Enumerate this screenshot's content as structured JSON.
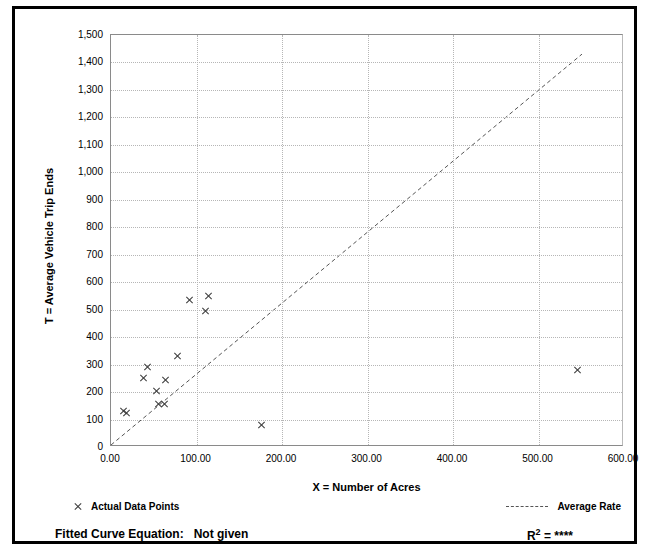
{
  "chart_data": {
    "type": "scatter",
    "title": "",
    "xlabel": "X = Number of Acres",
    "ylabel": "T = Average Vehicle Trip Ends",
    "xlim": [
      0,
      600
    ],
    "ylim": [
      0,
      1500
    ],
    "xticks": [
      "0.00",
      "100.00",
      "200.00",
      "300.00",
      "400.00",
      "500.00",
      "600.00"
    ],
    "xtick_values": [
      0,
      100,
      200,
      300,
      400,
      500,
      600
    ],
    "yticks": [
      "0",
      "100",
      "200",
      "300",
      "400",
      "500",
      "600",
      "700",
      "800",
      "900",
      "1,000",
      "1,100",
      "1,200",
      "1,300",
      "1,400",
      "1,500"
    ],
    "ytick_values": [
      0,
      100,
      200,
      300,
      400,
      500,
      600,
      700,
      800,
      900,
      1000,
      1100,
      1200,
      1300,
      1400,
      1500
    ],
    "grid": true,
    "legend_position": "below-plot",
    "series": [
      {
        "name": "Actual Data Points",
        "marker": "x",
        "color": "#3a3a3a",
        "points": [
          {
            "x": 15,
            "y": 130
          },
          {
            "x": 18,
            "y": 122
          },
          {
            "x": 38,
            "y": 250
          },
          {
            "x": 43,
            "y": 290
          },
          {
            "x": 53,
            "y": 205
          },
          {
            "x": 56,
            "y": 155
          },
          {
            "x": 63,
            "y": 158
          },
          {
            "x": 64,
            "y": 245
          },
          {
            "x": 78,
            "y": 330
          },
          {
            "x": 92,
            "y": 535
          },
          {
            "x": 110,
            "y": 495
          },
          {
            "x": 114,
            "y": 550
          },
          {
            "x": 176,
            "y": 80
          },
          {
            "x": 546,
            "y": 280
          }
        ]
      },
      {
        "name": "Average Rate",
        "style": "dashed",
        "color": "#555555",
        "line": {
          "x0": 0,
          "y0": 0,
          "x1": 553,
          "y1": 1430
        }
      }
    ]
  },
  "axis": {
    "x_title": "X = Number of Acres",
    "y_title": "T = Average Vehicle Trip Ends"
  },
  "legend": {
    "actual_points_label": "Actual Data Points",
    "average_rate_label": "Average Rate"
  },
  "footer": {
    "fitted_curve_label": "Fitted Curve Equation:",
    "fitted_curve_value": "Not given",
    "r2_symbol": "R",
    "r2_exponent": "2",
    "r2_equals": " = ",
    "r2_value": "****"
  }
}
